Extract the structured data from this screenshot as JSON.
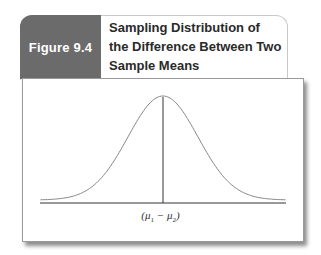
{
  "figure": {
    "label": "Figure 9.4",
    "title": "Sampling Distribution of the Difference Between Two Sample Means",
    "title_lines": [
      "Sampling Distribution of",
      "the Difference Between Two",
      "Sample Means"
    ],
    "label_color": "#6b6b6b"
  },
  "chart_data": {
    "type": "line",
    "title": "Sampling Distribution of the Difference Between Two Sample Means",
    "xlabel": "",
    "ylabel": "",
    "center_tick_label": "(μ1 − μ2)",
    "center_tick_label_parts": {
      "open": "(μ",
      "sub1": "1",
      "mid": " − μ",
      "sub2": "2",
      "close": ")"
    },
    "grid": false,
    "legend": null,
    "series": [
      {
        "name": "sampling distribution",
        "shape": "normal",
        "mean": 0,
        "sd": 1,
        "x": [
          -3.5,
          -3,
          -2.5,
          -2,
          -1.5,
          -1,
          -0.5,
          0,
          0.5,
          1,
          1.5,
          2,
          2.5,
          3,
          3.5
        ],
        "values": [
          0.001,
          0.004,
          0.018,
          0.054,
          0.13,
          0.242,
          0.352,
          0.399,
          0.352,
          0.242,
          0.13,
          0.054,
          0.018,
          0.004,
          0.001
        ]
      }
    ],
    "center_line": {
      "x": 0
    }
  }
}
